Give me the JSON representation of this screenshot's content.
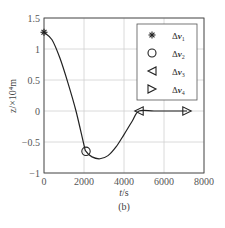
{
  "chart_data": {
    "type": "line",
    "title": "",
    "caption": "(b)",
    "xlabel": "t/s",
    "ylabel": "z/×10⁴m",
    "xlim": [
      0,
      8000
    ],
    "ylim": [
      -1,
      1.5
    ],
    "x_ticks": [
      "0",
      "2000",
      "4000",
      "6000",
      "8000"
    ],
    "y_ticks": [
      "1.5",
      "1",
      "0.5",
      "0",
      "-0.5",
      "-1"
    ],
    "grid": true,
    "legend_position": "upper right",
    "series": [
      {
        "name": "trajectory",
        "x": [
          0,
          400,
          800,
          1200,
          1600,
          2000,
          2100,
          2400,
          2800,
          3200,
          3600,
          4000,
          4400,
          4750,
          5500,
          6500,
          7150
        ],
        "values": [
          1.27,
          1.15,
          0.85,
          0.45,
          0.0,
          -0.55,
          -0.65,
          -0.74,
          -0.77,
          -0.72,
          -0.58,
          -0.38,
          -0.17,
          0.0,
          0.0,
          0.0,
          0.0
        ]
      }
    ],
    "markers": [
      {
        "name": "Δv1",
        "symbol": "asterisk",
        "x": 0,
        "y": 1.27
      },
      {
        "name": "Δv2",
        "symbol": "circle",
        "x": 2100,
        "y": -0.65
      },
      {
        "name": "Δv3",
        "symbol": "triangle-left",
        "x": 4750,
        "y": 0
      },
      {
        "name": "Δv4",
        "symbol": "triangle-right",
        "x": 7150,
        "y": 0
      }
    ]
  },
  "legend": {
    "items": [
      {
        "symbol": "asterisk",
        "label_main": "Δ",
        "label_var": "v",
        "label_sub": "1"
      },
      {
        "symbol": "circle",
        "label_main": "Δ",
        "label_var": "v",
        "label_sub": "2"
      },
      {
        "symbol": "triangle-left",
        "label_main": "Δ",
        "label_var": "v",
        "label_sub": "3"
      },
      {
        "symbol": "triangle-right",
        "label_main": "Δ",
        "label_var": "v",
        "label_sub": "4"
      }
    ]
  },
  "labels": {
    "xlabel_var": "t",
    "xlabel_unit": "/s",
    "ylabel": "z/×10⁴m",
    "caption": "(b)"
  }
}
